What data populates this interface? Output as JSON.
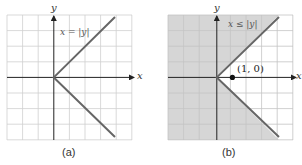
{
  "figure": {
    "panels": [
      {
        "id": "a",
        "caption": "(a)",
        "equation_label": "x = |y|",
        "x_axis_label": "x",
        "y_axis_label": "y",
        "shaded": false
      },
      {
        "id": "b",
        "caption": "(b)",
        "equation_label": "x ≤ |y|",
        "x_axis_label": "x",
        "y_axis_label": "y",
        "shaded": true,
        "point_label": "(1, 0)"
      }
    ],
    "colors": {
      "grid": "#cfcfcf",
      "axis": "#222222",
      "curve": "#666666",
      "shade": "#d6d6d6",
      "label": "#555555"
    }
  }
}
